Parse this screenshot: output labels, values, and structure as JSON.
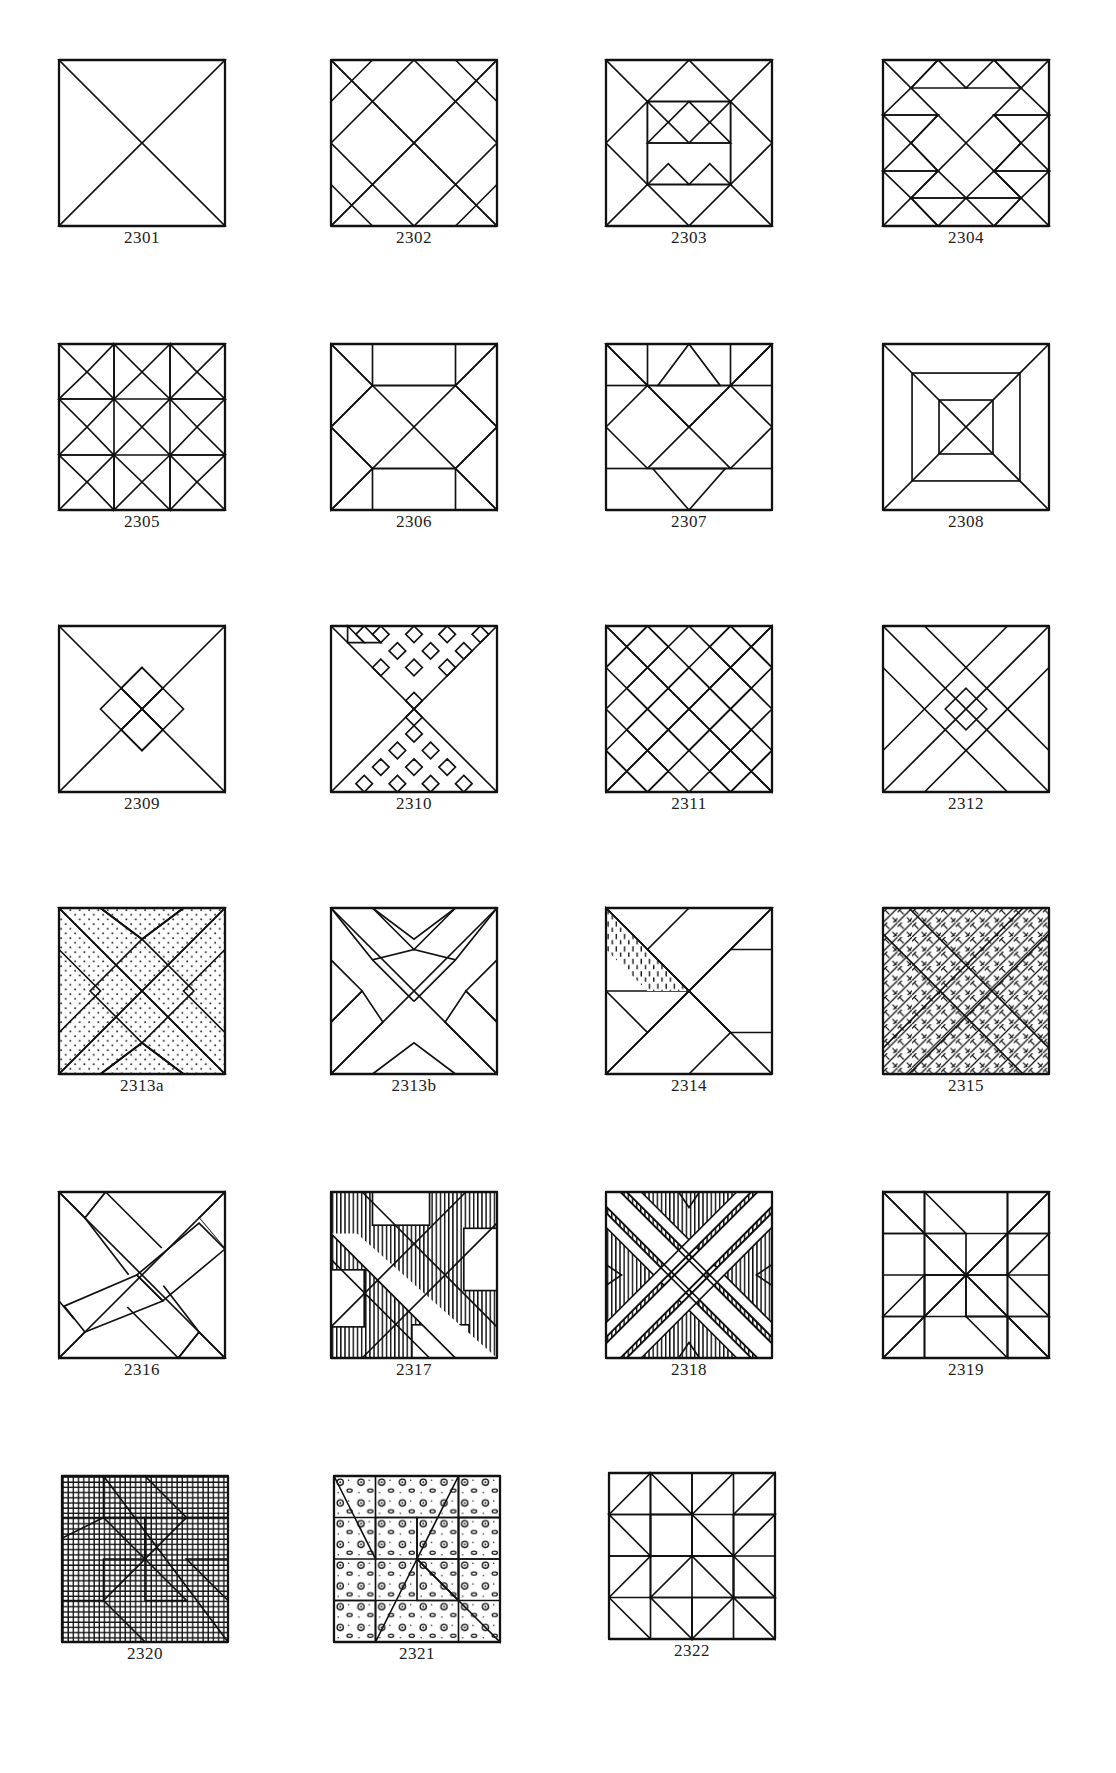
{
  "page": {
    "blocks": [
      {
        "id": "2301",
        "label": "2301",
        "pattern": "hourglass-vertical-stripes"
      },
      {
        "id": "2302",
        "label": "2302",
        "pattern": "diagonal-lattice"
      },
      {
        "id": "2303",
        "label": "2303",
        "pattern": "star-with-center-checker"
      },
      {
        "id": "2304",
        "label": "2304",
        "pattern": "triangles-star"
      },
      {
        "id": "2305",
        "label": "2305",
        "pattern": "ohio-star-nine-patch"
      },
      {
        "id": "2306",
        "label": "2306",
        "pattern": "double-diamond-crosshatch"
      },
      {
        "id": "2307",
        "label": "2307",
        "pattern": "hourglass-with-bands"
      },
      {
        "id": "2308",
        "label": "2308",
        "pattern": "concentric-squares-x"
      },
      {
        "id": "2309",
        "label": "2309",
        "pattern": "bowtie-floral"
      },
      {
        "id": "2310",
        "label": "2310",
        "pattern": "hourglass-checker-triangles"
      },
      {
        "id": "2311",
        "label": "2311",
        "pattern": "diagonal-checker-zigzag"
      },
      {
        "id": "2312",
        "label": "2312",
        "pattern": "double-x-dots"
      },
      {
        "id": "2313a",
        "label": "2313a",
        "pattern": "x-lattice-stars"
      },
      {
        "id": "2313b",
        "label": "2313b",
        "pattern": "x-lattice-checks"
      },
      {
        "id": "2314",
        "label": "2314",
        "pattern": "pinwheel-dashes"
      },
      {
        "id": "2315",
        "label": "2315",
        "pattern": "white-x-woven"
      },
      {
        "id": "2316",
        "label": "2316",
        "pattern": "crossed-bars-dark-corners"
      },
      {
        "id": "2317",
        "label": "2317",
        "pattern": "white-x-rectangles"
      },
      {
        "id": "2318",
        "label": "2318",
        "pattern": "triple-stripe-x"
      },
      {
        "id": "2319",
        "label": "2319",
        "pattern": "star-basketweave"
      },
      {
        "id": "2320",
        "label": "2320",
        "pattern": "pinwheel-grid-floral"
      },
      {
        "id": "2321",
        "label": "2321",
        "pattern": "pinwheel-floral-dots"
      },
      {
        "id": "2322",
        "label": "2322",
        "pattern": "scrappy-triangles"
      }
    ]
  },
  "colors": {
    "ink": "#111111",
    "paper": "#ffffff",
    "label": "#222222"
  }
}
